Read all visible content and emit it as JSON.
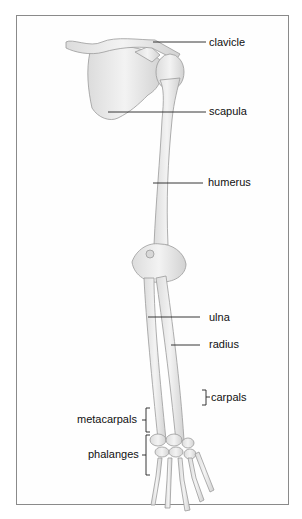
{
  "diagram": {
    "labels": {
      "clavicle": "clavicle",
      "scapula": "scapula",
      "humerus": "humerus",
      "ulna": "ulna",
      "radius": "radius",
      "carpals": "carpals",
      "metacarpals": "metacarpals",
      "phalanges": "phalanges"
    },
    "colors": {
      "bone": "#ececec",
      "bone_outline": "#9a9a9a",
      "leader_line": "#222222",
      "frame": "#8a8a8a"
    }
  }
}
